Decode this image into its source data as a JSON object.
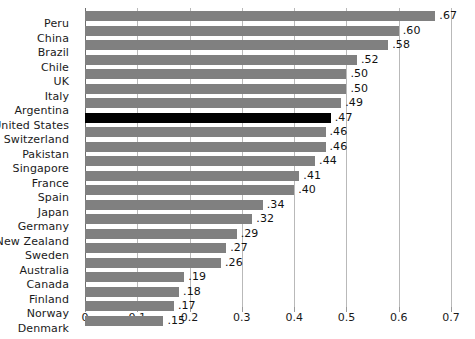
{
  "chart_data": {
    "type": "bar",
    "orientation": "horizontal",
    "title": "",
    "subtitle": "",
    "xlabel": "",
    "ylabel": "",
    "xlim": [
      0,
      0.7
    ],
    "grid": true,
    "legend": false,
    "tick_labels": [
      "0",
      "0.1",
      "0.2",
      "0.3",
      "0.4",
      "0.5",
      "0.6",
      "0.7"
    ],
    "tick_values": [
      0,
      0.1,
      0.2,
      0.3,
      0.4,
      0.5,
      0.6,
      0.7
    ],
    "bar_color": "#808080",
    "highlight_color": "#000000",
    "highlight_category": "United States",
    "categories": [
      "Peru",
      "China",
      "Brazil",
      "Chile",
      "UK",
      "Italy",
      "Argentina",
      "United States",
      "Switzerland",
      "Pakistan",
      "Singapore",
      "France",
      "Spain",
      "Japan",
      "Germany",
      "New Zealand",
      "Sweden",
      "Australia",
      "Canada",
      "Finland",
      "Norway",
      "Denmark"
    ],
    "values": [
      0.67,
      0.6,
      0.58,
      0.52,
      0.5,
      0.5,
      0.49,
      0.47,
      0.46,
      0.46,
      0.44,
      0.41,
      0.4,
      0.34,
      0.32,
      0.29,
      0.27,
      0.26,
      0.19,
      0.18,
      0.17,
      0.15
    ],
    "value_labels": [
      ".67",
      ".60",
      ".58",
      ".52",
      ".50",
      ".50",
      ".49",
      ".47",
      ".46",
      ".46",
      ".44",
      ".41",
      ".40",
      ".34",
      ".32",
      ".29",
      ".27",
      ".26",
      ".19",
      ".18",
      ".17",
      ".15"
    ]
  }
}
